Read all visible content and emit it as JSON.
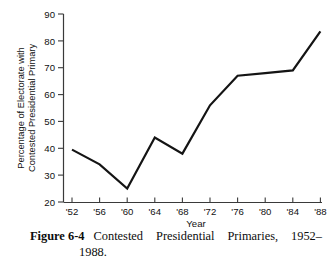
{
  "chart_data": {
    "type": "line",
    "title": "",
    "xlabel": "Year",
    "ylabel": "Percentage of Electorate with Contested Presidential Primary",
    "ylabel_line1": "Percentage of Electorate with",
    "ylabel_line2": "Contested Presidential Primary",
    "categories": [
      "'52",
      "'56",
      "'60",
      "'64",
      "'68",
      "'72",
      "'76",
      "'80",
      "'84",
      "'88"
    ],
    "x_values": [
      1952,
      1956,
      1960,
      1964,
      1968,
      1972,
      1976,
      1980,
      1984,
      1988
    ],
    "values": [
      39.5,
      34,
      25,
      44,
      38,
      56,
      67,
      68,
      69,
      83.5
    ],
    "yticks": [
      20,
      30,
      40,
      50,
      60,
      70,
      80,
      90
    ],
    "ytick_labels": [
      "20",
      "30",
      "40",
      "50",
      "60",
      "70",
      "80",
      "90"
    ],
    "xtick_labels": [
      "'52",
      "'56",
      "'60",
      "'64",
      "'68",
      "'72",
      "'76",
      "'80",
      "'84",
      "'88"
    ],
    "ylim": [
      20,
      90
    ],
    "xlim": [
      1952,
      1988
    ],
    "grid": false,
    "legend": null,
    "line_color": "#141414",
    "axis_color": "#3a3a3a"
  },
  "caption": {
    "figure_number": "Figure 6-4",
    "text_line1": "Contested Presidential Primaries, 1952–",
    "text_line2": "1988.",
    "full_text": "Figure 6-4  Contested Presidential Primaries, 1952–1988."
  }
}
